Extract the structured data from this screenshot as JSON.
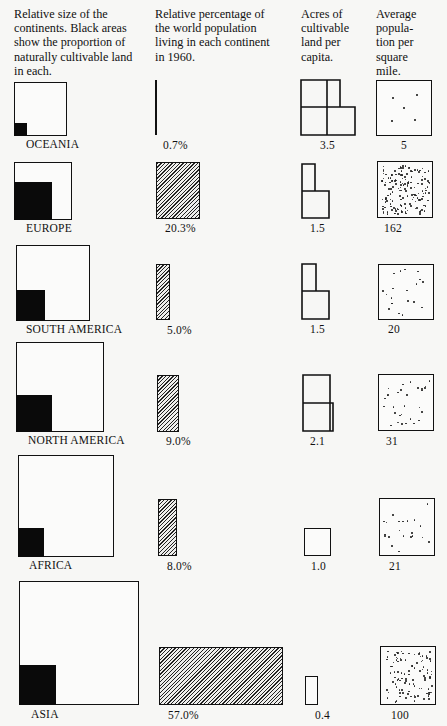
{
  "headers": {
    "size": "Relative size of the\ncontinents. Black areas\nshow the proportion of\nnaturally cultivable land\nin each.",
    "population": "Relative percentage of\nthe world population\nliving in each continent\nin 1960.",
    "acres": "Acres of\ncultivable\nland per\ncapita.",
    "density": "Average\npopula-\ntion per\nsquare\nmile."
  },
  "rows": [
    {
      "name": "OCEANIA",
      "pop_pct": "0.7%",
      "acres": "3.5",
      "density": "5"
    },
    {
      "name": "EUROPE",
      "pop_pct": "20.3%",
      "acres": "1.5",
      "density": "162"
    },
    {
      "name": "SOUTH AMERICA",
      "pop_pct": "5.0%",
      "acres": "1.5",
      "density": "20"
    },
    {
      "name": "NORTH AMERICA",
      "pop_pct": "9.0%",
      "acres": "2.1",
      "density": "31"
    },
    {
      "name": "AFRICA",
      "pop_pct": "8.0%",
      "acres": "1.0",
      "density": "21"
    },
    {
      "name": "ASIA",
      "pop_pct": "57.0%",
      "acres": "0.4",
      "density": "100"
    }
  ],
  "chart_data": {
    "type": "table",
    "title": "",
    "columns": [
      "Relative size of the continents (black = naturally cultivable land)",
      "Relative percentage of the world population living in each continent in 1960",
      "Acres of cultivable land per capita",
      "Average population per square mile"
    ],
    "categories": [
      "Oceania",
      "Europe",
      "South America",
      "North America",
      "Africa",
      "Asia"
    ],
    "series": [
      {
        "name": "World population share 1960 (%)",
        "values": [
          0.7,
          20.3,
          5.0,
          9.0,
          8.0,
          57.0
        ]
      },
      {
        "name": "Acres of cultivable land per capita",
        "values": [
          3.5,
          1.5,
          1.5,
          2.1,
          1.0,
          0.4
        ]
      },
      {
        "name": "Average population per square mile",
        "values": [
          5,
          162,
          20,
          31,
          21,
          100
        ]
      }
    ],
    "graphics": {
      "continent_square_side_px": [
        53,
        58,
        73,
        87,
        95,
        119
      ],
      "cultivable_square_side_px": [
        13,
        38,
        29,
        36,
        26,
        37
      ]
    },
    "legend": "none",
    "grid": false
  }
}
